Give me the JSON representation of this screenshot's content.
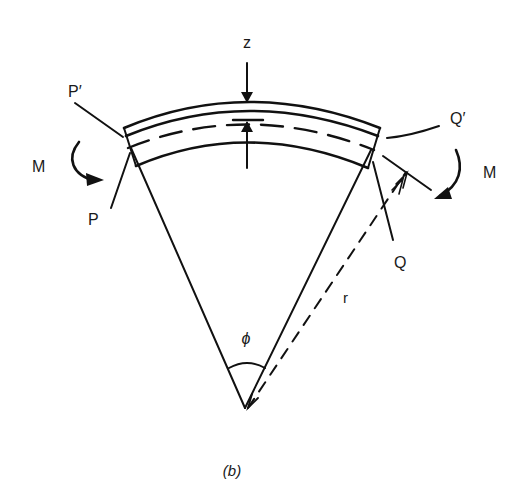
{
  "figure": {
    "caption": "(b)"
  },
  "labels": {
    "z": "z",
    "p_prime": "P′",
    "p": "P",
    "q_prime": "Q′",
    "q": "Q",
    "m_left": "M",
    "m_right": "M",
    "r": "r",
    "phi": "ϕ"
  },
  "colors": {
    "ink": "#111111",
    "background": "#ffffff"
  }
}
